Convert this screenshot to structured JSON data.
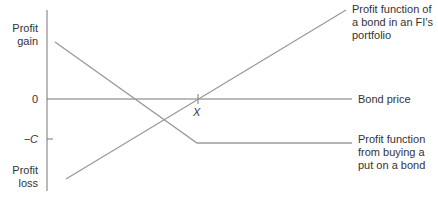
{
  "axes": {
    "y_top_label": "Profit gain",
    "y_top_lines": [
      "Profit",
      "gain"
    ],
    "y_bottom_lines": [
      "Profit",
      "loss"
    ],
    "zero_label": "0",
    "minus_c_label": "−C",
    "x_axis_label": "Bond price",
    "strike_label": "X"
  },
  "series": {
    "bond": {
      "label_lines": [
        "Profit function of",
        "a bond in an FI's",
        "portfolio"
      ]
    },
    "put": {
      "label_lines": [
        "Profit function",
        "from buying a",
        "put on a bond"
      ]
    }
  },
  "colors": {
    "axis": "#666666",
    "line": "#999999",
    "text": "#333333"
  }
}
